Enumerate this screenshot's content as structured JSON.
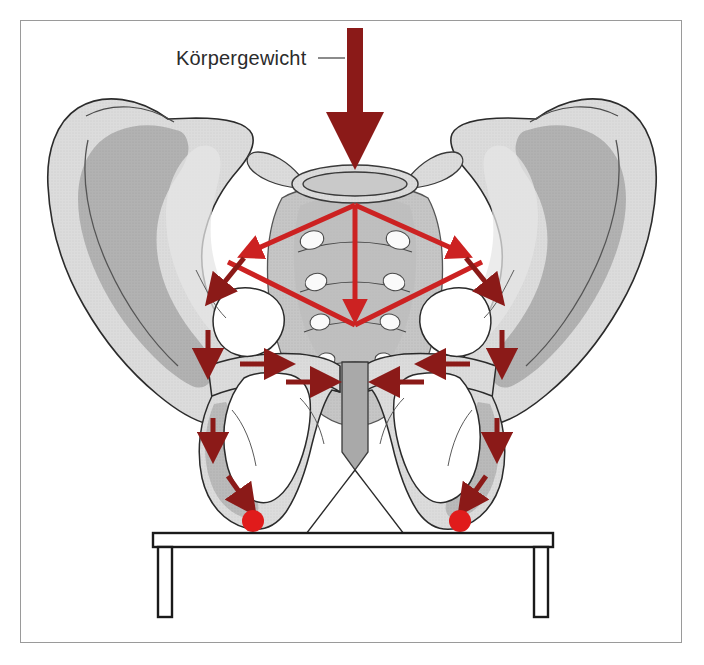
{
  "figure": {
    "title": "Körpergewicht",
    "background_color": "#ffffff",
    "frame_color": "#9a9a9a"
  },
  "labels": {
    "body_weight": "Körpergewicht",
    "leader_line": "leader-line"
  },
  "colors": {
    "dark_red": "#8B1A18",
    "bright_red": "#CC2222",
    "dot_red": "#E01B1B",
    "bone_light": "#d9d9d9",
    "bone_mid": "#c3c3c3",
    "bone_dark": "#a8a8a8",
    "bone_darker": "#9b9b9b",
    "outline": "#2b2b2b",
    "white": "#ffffff",
    "text": "#2b2b2b",
    "frame": "#9a9a9a"
  },
  "elements": {
    "body_weight_arrow": "vertical dark red load arrow from top into sacral promontory",
    "force_diamond": "bright red rhombus over sacrum showing load transfer",
    "diamond_center_arrow": "bright red vertical arrow through sacrum",
    "acetabular_arrows": "dark red arrows into hip sockets",
    "symphysis_arrows": "dark red horizontal arrows compressing pubic symphysis",
    "ischial_arrows": "dark red arrows descending to ischial tuberosities",
    "tuberosity_dots": "red contact points at ischial tuberosities",
    "bench": "black outlined seat with two legs"
  },
  "geometry": {
    "diamond": {
      "top": [
        355,
        205
      ],
      "left": [
        228,
        262
      ],
      "right": [
        482,
        262
      ],
      "bottom": [
        355,
        325
      ]
    },
    "tuberosity_dots": [
      {
        "cx": 253,
        "cy": 521,
        "r": 11
      },
      {
        "cx": 460,
        "cy": 521,
        "r": 11
      }
    ],
    "bench": {
      "x": 153,
      "y": 533,
      "width": 400,
      "height": 12,
      "leg_width": 14,
      "leg_height": 70
    }
  }
}
